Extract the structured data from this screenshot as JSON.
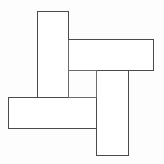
{
  "canvas": {
    "width": 164,
    "height": 164,
    "background_color": "#fdfdfd",
    "title": "Pinwheel of four interlocking bars"
  },
  "style": {
    "stroke_color": "#6b6b6b",
    "stroke_color_dark": "#4a4a4a",
    "fill_color": "#ffffff",
    "stroke_width": 1
  },
  "figure": {
    "name": "interlocking-bars-pinwheel",
    "shape_count": 4,
    "shapes": [
      {
        "id": "bar-top-left-vertical",
        "label": "vertical bar, upper left",
        "orientation": "vertical",
        "x": 37,
        "y": 11,
        "width": 31,
        "height": 86,
        "z": 4
      },
      {
        "id": "bar-top-right-horizontal",
        "label": "horizontal bar, upper right",
        "orientation": "horizontal",
        "x": 68,
        "y": 39,
        "width": 85,
        "height": 31,
        "z": 3
      },
      {
        "id": "bar-bottom-right-vertical",
        "label": "vertical bar, lower right",
        "orientation": "vertical",
        "x": 96,
        "y": 70,
        "width": 32,
        "height": 85,
        "z": 2
      },
      {
        "id": "bar-bottom-left-horizontal",
        "label": "horizontal bar, lower left",
        "orientation": "horizontal",
        "x": 8,
        "y": 97,
        "width": 88,
        "height": 31,
        "z": 1
      }
    ],
    "seam_lines": [
      {
        "id": "seam-vertical-a-right",
        "x1": 68,
        "y1": 39,
        "x2": 68,
        "y2": 97
      },
      {
        "id": "seam-horizontal-b-bottom-left",
        "x1": 68,
        "y1": 70,
        "x2": 96,
        "y2": 70
      },
      {
        "id": "seam-vertical-c-left-upper",
        "x1": 96,
        "y1": 70,
        "x2": 96,
        "y2": 97
      },
      {
        "id": "seam-horizontal-d-top-right",
        "x1": 68,
        "y1": 97,
        "x2": 96,
        "y2": 97
      }
    ]
  }
}
